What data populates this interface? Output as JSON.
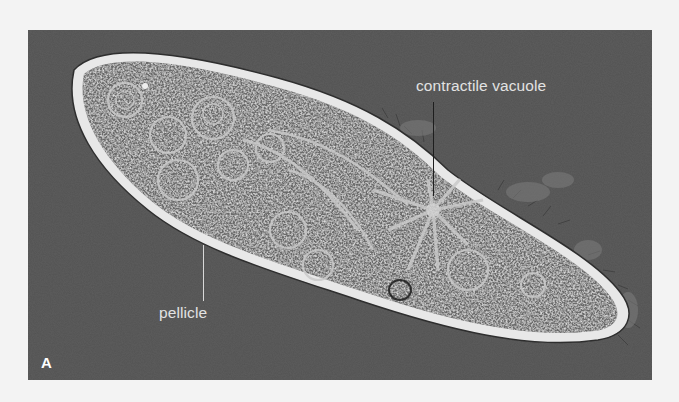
{
  "figure": {
    "panel_letter": "A",
    "labels": {
      "contractile_vacuole": "contractile vacuole",
      "pellicle": "pellicle"
    },
    "colors": {
      "background_outside_frame": "#f3f3f3",
      "photo_background": "#5a5a5a",
      "cell_interior": "#6e6e6e",
      "pellicle_rim": "#e6e6e6",
      "label_text": "#e2e2e2",
      "panel_letter": "#ffffff"
    }
  }
}
